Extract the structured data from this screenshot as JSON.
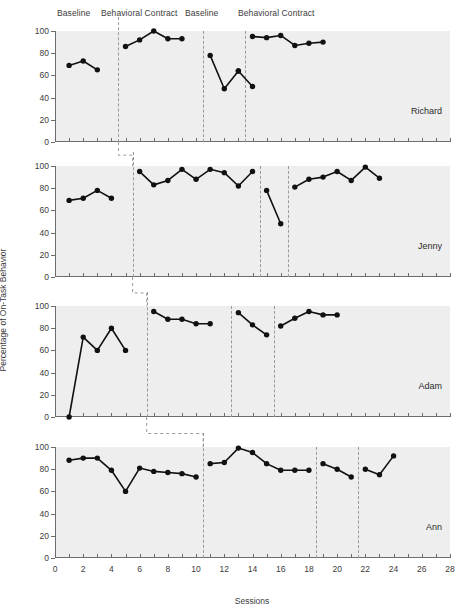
{
  "figure": {
    "xlabel": "Sessions",
    "ylabel": "Percentage of On-Task Behavior"
  },
  "phase_headers": [
    {
      "label": "Baseline",
      "x": 57
    },
    {
      "label": "Behavioral Contract",
      "x": 101
    },
    {
      "label": "Baseline",
      "x": 185
    },
    {
      "label": "Behavioral Contract",
      "x": 238
    }
  ],
  "axes": {
    "y_ticks": [
      0,
      20,
      40,
      60,
      80,
      100
    ],
    "y_min": 0,
    "y_max": 100,
    "x_ticks": [
      0,
      1,
      2,
      3,
      4,
      5,
      6,
      7,
      8,
      9,
      10,
      11,
      12,
      13,
      14,
      15,
      16,
      17,
      18,
      19,
      20,
      21,
      22,
      23,
      24,
      25,
      26,
      27,
      28
    ],
    "x_labels": [
      0,
      2,
      4,
      6,
      8,
      10,
      12,
      14,
      16,
      18,
      20,
      22,
      24,
      26,
      28
    ],
    "x_min": 0,
    "x_max": 28
  },
  "chart_data": {
    "type": "line",
    "title": "",
    "xlabel": "Sessions",
    "ylabel": "Percentage of On-Task Behavior",
    "xlim": [
      0,
      28
    ],
    "ylim": [
      0,
      100
    ],
    "grid": false,
    "legend": "none",
    "design": "multiple-baseline A-B-A-B reversal across subjects",
    "phase_labels": [
      "Baseline",
      "Behavioral Contract",
      "Baseline",
      "Behavioral Contract"
    ],
    "panels": [
      {
        "subject": "Richard",
        "phase_lines": [
          4.5,
          10.5,
          13.5
        ],
        "segments": [
          {
            "phase": "Baseline",
            "x": [
              1,
              2,
              3
            ],
            "y": [
              69,
              73,
              65
            ]
          },
          {
            "phase": "Behavioral Contract",
            "x": [
              5,
              6,
              7,
              8,
              9
            ],
            "y": [
              86,
              92,
              100,
              93,
              93
            ]
          },
          {
            "phase": "Baseline",
            "x": [
              11,
              12,
              13
            ],
            "y": [
              78,
              48,
              64
            ]
          },
          {
            "phase": "Baseline-tail",
            "x": [
              13,
              14
            ],
            "y": [
              64,
              50
            ]
          },
          {
            "phase": "Behavioral Contract",
            "x": [
              14,
              15,
              16,
              17,
              18,
              19
            ],
            "y": [
              95,
              94,
              96,
              87,
              89,
              90
            ]
          }
        ]
      },
      {
        "subject": "Jenny",
        "phase_lines": [
          5.5,
          14.5,
          16.5
        ],
        "segments": [
          {
            "phase": "Baseline",
            "x": [
              1,
              2,
              3,
              4
            ],
            "y": [
              69,
              71,
              78,
              71
            ]
          },
          {
            "phase": "Behavioral Contract",
            "x": [
              6,
              7,
              8,
              9,
              10,
              11,
              12,
              13,
              14
            ],
            "y": [
              95,
              83,
              87,
              97,
              88,
              97,
              94,
              82,
              95
            ]
          },
          {
            "phase": "Baseline",
            "x": [
              15,
              16
            ],
            "y": [
              78,
              48
            ]
          },
          {
            "phase": "Behavioral Contract",
            "x": [
              17,
              18,
              19,
              20,
              21,
              22,
              23
            ],
            "y": [
              81,
              88,
              90,
              95,
              87,
              99,
              89
            ]
          }
        ]
      },
      {
        "subject": "Adam",
        "phase_lines": [
          6.5,
          12.5,
          15.5
        ],
        "segments": [
          {
            "phase": "Baseline",
            "x": [
              1,
              2,
              3,
              4,
              5
            ],
            "y": [
              0,
              72,
              60,
              80,
              60
            ]
          },
          {
            "phase": "Behavioral Contract",
            "x": [
              7,
              8,
              9,
              10,
              11
            ],
            "y": [
              95,
              88,
              88,
              84,
              84
            ]
          },
          {
            "phase": "Baseline",
            "x": [
              13,
              14,
              15
            ],
            "y": [
              94,
              83,
              74
            ]
          },
          {
            "phase": "Behavioral Contract",
            "x": [
              16,
              17,
              18,
              19,
              20
            ],
            "y": [
              82,
              89,
              95,
              92,
              92
            ]
          }
        ]
      },
      {
        "subject": "Ann",
        "phase_lines": [
          10.5,
          18.5,
          21.5
        ],
        "segments": [
          {
            "phase": "Baseline",
            "x": [
              1,
              2,
              3,
              4,
              5,
              6,
              7,
              8,
              9,
              10
            ],
            "y": [
              88,
              90,
              90,
              79,
              60,
              81,
              78,
              77,
              76,
              73
            ]
          },
          {
            "phase": "Behavioral Contract",
            "x": [
              11,
              12,
              13,
              14,
              15,
              16,
              17,
              18
            ],
            "y": [
              85,
              86,
              99,
              95,
              85,
              79,
              79,
              79
            ]
          },
          {
            "phase": "Baseline",
            "x": [
              19,
              20,
              21
            ],
            "y": [
              85,
              80,
              73
            ]
          },
          {
            "phase": "Behavioral Contract",
            "x": [
              22,
              23,
              24
            ],
            "y": [
              80,
              75,
              92
            ]
          }
        ]
      }
    ]
  }
}
